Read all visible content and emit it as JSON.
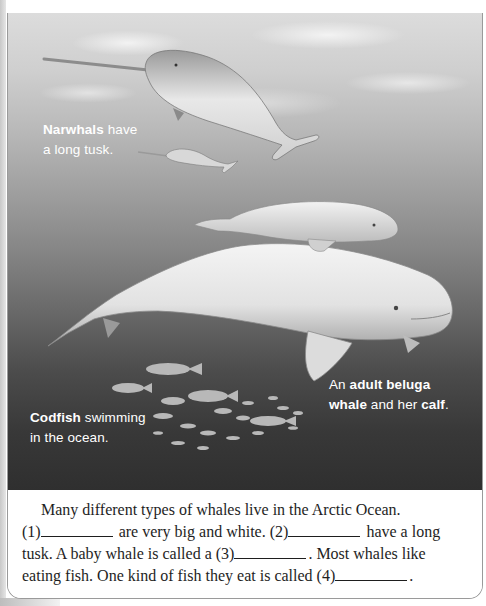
{
  "photo": {
    "captions": {
      "narwhal": {
        "bold": "Narwhals",
        "line1_rest": " have",
        "line2": "a long tusk."
      },
      "beluga": {
        "pre": "An ",
        "bold1": "adult beluga",
        "bold2": "whale",
        "mid": " and her ",
        "bold3": "calf",
        "post": "."
      },
      "codfish": {
        "bold": "Codfish",
        "line1_rest": " swimming",
        "line2": "in the ocean."
      }
    }
  },
  "exercise": {
    "line1": "Many different types of whales live in the Arctic Ocean.",
    "blank1_label": "(1)",
    "seg1": " are very big and white. ",
    "blank2_label": "(2)",
    "seg2": " have a long",
    "seg3": "tusk. A baby whale is called a ",
    "blank3_label": "(3)",
    "seg4": ". Most whales like",
    "seg5": "eating fish. One kind of fish they eat is called ",
    "blank4_label": "(4)",
    "seg6": "."
  },
  "colors": {
    "photo_top": "#dcdcdc",
    "photo_bottom": "#2f2f2f",
    "caption_text": "#ffffff",
    "body_text": "#1e1e1e",
    "frame_border": "#9a9a9a"
  }
}
